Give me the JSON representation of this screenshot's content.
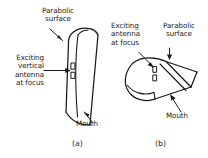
{
  "figure": {
    "caption_a": "(a)",
    "caption_b": "(b)",
    "panel_a": {
      "label_parabolic_surface": "Parabolic\nsurface",
      "label_exciting_antenna": "Exciting\nvertical\nantenna\nat focus",
      "label_mouth": "Mouth",
      "shape_name": "parabolic-cylinder-front-view",
      "antenna_name": "vertical-dipole-antenna"
    },
    "panel_b": {
      "label_exciting_antenna": "Exciting\nantenna\nat focus",
      "label_parabolic_surface": "Parabolic\nsurface",
      "label_mouth": "Mouth",
      "shape_name": "parabolic-cylinder-perspective-view",
      "antenna_name": "dipole-antenna"
    },
    "colors": {
      "ink": "#1a1a1a",
      "background": "#ffffff"
    }
  }
}
